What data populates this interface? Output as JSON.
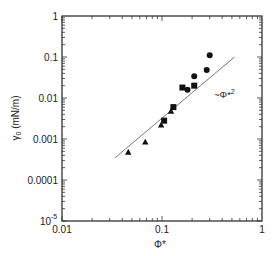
{
  "chart_data": {
    "type": "scatter",
    "title": "",
    "xlabel": "Φ*",
    "ylabel": "γ0 (mN/m)",
    "xscale": "log",
    "yscale": "log",
    "xlim": [
      0.01,
      1
    ],
    "ylim": [
      1e-05,
      1
    ],
    "x_ticks": [
      "0.01",
      "0.1",
      "1"
    ],
    "y_ticks": [
      "10^-5",
      "0.0001",
      "0.001",
      "0.01",
      "0.1",
      "1"
    ],
    "grid": false,
    "legend": null,
    "series": [
      {
        "name": "triangles",
        "marker": "triangle",
        "points": [
          {
            "x": 0.046,
            "y": 0.00048
          },
          {
            "x": 0.068,
            "y": 0.00085
          },
          {
            "x": 0.098,
            "y": 0.0022
          },
          {
            "x": 0.123,
            "y": 0.0048
          }
        ]
      },
      {
        "name": "squares",
        "marker": "square",
        "points": [
          {
            "x": 0.105,
            "y": 0.0028
          },
          {
            "x": 0.13,
            "y": 0.006
          },
          {
            "x": 0.16,
            "y": 0.018
          },
          {
            "x": 0.21,
            "y": 0.02
          }
        ]
      },
      {
        "name": "circles",
        "marker": "circle",
        "points": [
          {
            "x": 0.18,
            "y": 0.016
          },
          {
            "x": 0.21,
            "y": 0.034
          },
          {
            "x": 0.28,
            "y": 0.048
          },
          {
            "x": 0.3,
            "y": 0.11
          }
        ]
      }
    ],
    "reference_line": {
      "label": "~Φ*2",
      "slope_loglog": 2,
      "from": {
        "x": 0.034,
        "y": 0.00035
      },
      "to": {
        "x": 0.53,
        "y": 0.1
      }
    },
    "annotations": [
      {
        "text": "~Φ*",
        "superscript": "2",
        "x": 0.6,
        "y": 0.012
      }
    ]
  },
  "labels": {
    "x_axis": "Φ*",
    "y_axis_main": "γ",
    "y_axis_sub": "0",
    "y_axis_unit": " (mN/m)",
    "annotation_main": "~Φ*",
    "annotation_sup": "2",
    "y_ticks": {
      "t1": "1",
      "t01": "0.1",
      "t001": "0.01",
      "t0001": "0.001",
      "t00001": "0.0001",
      "t1e5_base": "10",
      "t1e5_exp": "-5"
    },
    "x_ticks": {
      "t001": "0.01",
      "t01": "0.1",
      "t1": "1"
    }
  }
}
